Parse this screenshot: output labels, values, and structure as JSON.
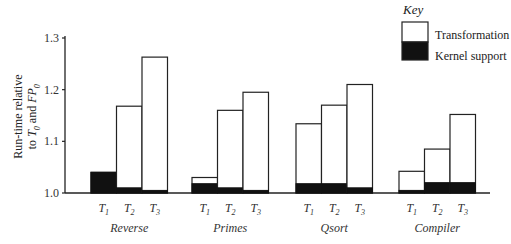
{
  "chart_data": {
    "type": "bar",
    "stacked": true,
    "title": "",
    "ylabel": "Run-time relative to T0 and FP0",
    "ylabel_lines": [
      "Run-time relative",
      "to T0 and FP0"
    ],
    "ylim": [
      1.0,
      1.3
    ],
    "yticks": [
      1.0,
      1.1,
      1.2,
      1.3
    ],
    "ytick_labels": [
      "1.0",
      "1.1",
      "1.2",
      "1.3"
    ],
    "grid": false,
    "legend": {
      "title": "Key",
      "position": "top-right",
      "entries": [
        {
          "name": "Transformation",
          "color": "#ffffff"
        },
        {
          "name": "Kernel support",
          "color": "#000000"
        }
      ]
    },
    "groups": [
      {
        "name": "Reverse",
        "bars": [
          {
            "label": "T1",
            "total": 1.04,
            "kernel": 1.04
          },
          {
            "label": "T2",
            "total": 1.168,
            "kernel": 1.01
          },
          {
            "label": "T3",
            "total": 1.263,
            "kernel": 1.005
          }
        ]
      },
      {
        "name": "Primes",
        "bars": [
          {
            "label": "T1",
            "total": 1.03,
            "kernel": 1.018
          },
          {
            "label": "T2",
            "total": 1.16,
            "kernel": 1.01
          },
          {
            "label": "T3",
            "total": 1.195,
            "kernel": 1.005
          }
        ]
      },
      {
        "name": "Qsort",
        "bars": [
          {
            "label": "T1",
            "total": 1.134,
            "kernel": 1.018
          },
          {
            "label": "T2",
            "total": 1.17,
            "kernel": 1.018
          },
          {
            "label": "T3",
            "total": 1.21,
            "kernel": 1.01
          }
        ]
      },
      {
        "name": "Compiler",
        "bars": [
          {
            "label": "T1",
            "total": 1.042,
            "kernel": 1.005
          },
          {
            "label": "T2",
            "total": 1.085,
            "kernel": 1.02
          },
          {
            "label": "T3",
            "total": 1.152,
            "kernel": 1.02
          }
        ]
      }
    ]
  },
  "legend": {
    "title": "Key",
    "transformation": "Transformation",
    "kernel": "Kernel support"
  }
}
